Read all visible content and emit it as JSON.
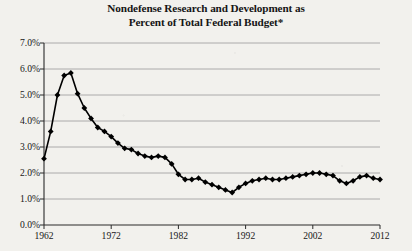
{
  "chart_data": {
    "type": "line",
    "title": "Nondefense Research and Development as Percent of Total Federal Budget*",
    "title_line1": "Nondefense Research and Development as",
    "title_line2": "Percent of Total Federal Budget*",
    "xlabel": "",
    "ylabel": "",
    "xlim": [
      1962,
      2012
    ],
    "ylim": [
      0,
      7
    ],
    "grid": true,
    "grid_axis": "y",
    "legend": false,
    "marker": "diamond",
    "marker_color": "#000000",
    "line_color": "#000000",
    "y_tick_labels": [
      "7.0%",
      "6.0%",
      "5.0%",
      "4.0%",
      "3.0%",
      "2.0%",
      "1.0%",
      "0.0%"
    ],
    "y_tick_values": [
      7,
      6,
      5,
      4,
      3,
      2,
      1,
      0
    ],
    "x_tick_labels": [
      "1962",
      "1972",
      "1982",
      "1992",
      "2002",
      "2012"
    ],
    "x_tick_values": [
      1962,
      1972,
      1982,
      1992,
      2002,
      2012
    ],
    "x": [
      1962,
      1963,
      1964,
      1965,
      1966,
      1967,
      1968,
      1969,
      1970,
      1971,
      1972,
      1973,
      1974,
      1975,
      1976,
      1977,
      1978,
      1979,
      1980,
      1981,
      1982,
      1983,
      1984,
      1985,
      1986,
      1987,
      1988,
      1989,
      1990,
      1991,
      1992,
      1993,
      1994,
      1995,
      1996,
      1997,
      1998,
      1999,
      2000,
      2001,
      2002,
      2003,
      2004,
      2005,
      2006,
      2007,
      2008,
      2009,
      2010,
      2011,
      2012
    ],
    "values": [
      2.55,
      3.6,
      5.0,
      5.75,
      5.85,
      5.05,
      4.5,
      4.1,
      3.75,
      3.6,
      3.4,
      3.15,
      2.95,
      2.9,
      2.75,
      2.65,
      2.6,
      2.65,
      2.6,
      2.35,
      1.95,
      1.75,
      1.75,
      1.8,
      1.65,
      1.55,
      1.45,
      1.35,
      1.25,
      1.45,
      1.6,
      1.7,
      1.75,
      1.8,
      1.75,
      1.75,
      1.8,
      1.85,
      1.9,
      1.95,
      2.0,
      2.0,
      1.95,
      1.9,
      1.7,
      1.6,
      1.7,
      1.85,
      1.9,
      1.8,
      1.75
    ],
    "series_name": "Nondefense R&D share of federal budget",
    "footnote_marker": "*"
  }
}
